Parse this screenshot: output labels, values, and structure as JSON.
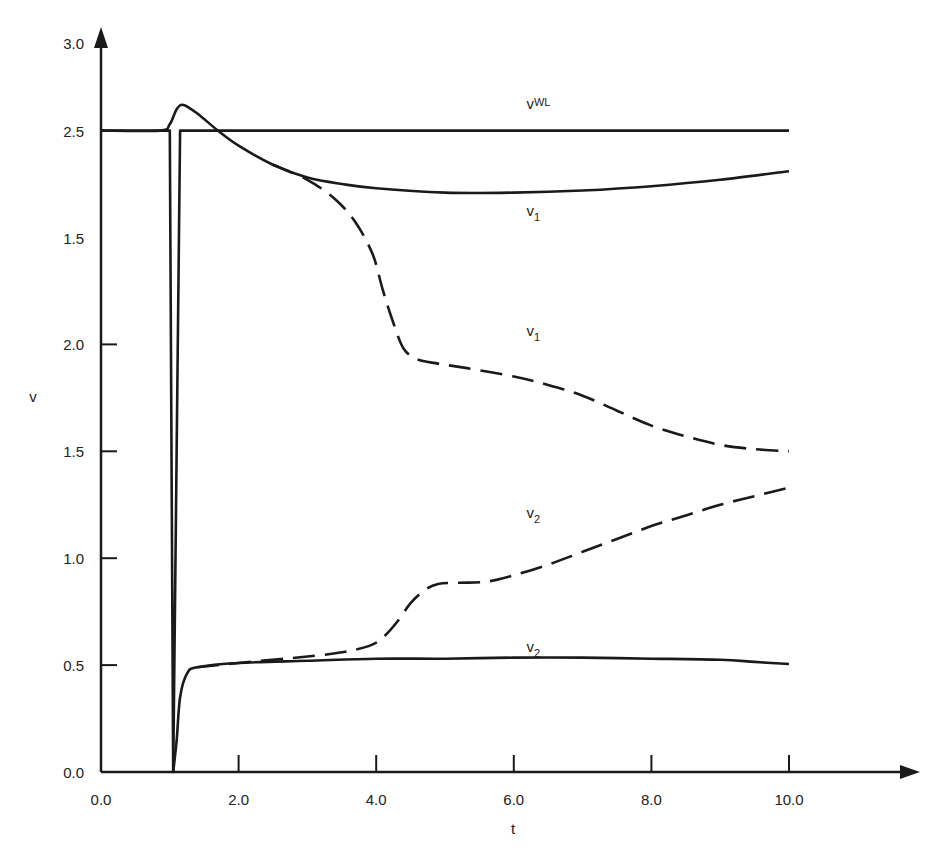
{
  "chart_data": {
    "type": "line",
    "title": "",
    "xlabel": "t",
    "ylabel": "v",
    "xlim": [
      0,
      12
    ],
    "ylim": [
      0,
      3.4
    ],
    "grid": false,
    "legend": "none (curves labeled inline)",
    "x_ticks": [
      "0.0",
      "2.0",
      "4.0",
      "6.0",
      "8.0",
      "10.0"
    ],
    "x_tick_values": [
      0,
      2,
      4,
      6,
      8,
      10
    ],
    "y_ticks": [
      "0.0",
      "0.5",
      "1.0",
      "1.5",
      "2.0",
      "1.5",
      "2.5",
      "3.0"
    ],
    "y_tick_positions": [
      0,
      0.5,
      1.0,
      1.5,
      2.0,
      2.5,
      3.0,
      3.41
    ],
    "y_tick_note": "Printed y-axis labels from bottom to top read 0.0, 0.5, 1.0, 1.5, 2.0, 1.5, 2.5, 3.0 (evenly spaced ticks; values below are in evenly spaced tick-position units)",
    "series": [
      {
        "name": "v_WL",
        "label": "v",
        "label_sub": "WL",
        "style": "solid",
        "x": [
          0,
          1.0,
          1.05,
          1.15,
          10.0
        ],
        "values": [
          3.0,
          3.0,
          0.0,
          3.0,
          3.0
        ]
      },
      {
        "name": "v_1 (solid)",
        "label": "v",
        "label_sub": "1",
        "style": "solid",
        "x": [
          0,
          0.85,
          1.0,
          1.1,
          1.2,
          1.4,
          1.7,
          2.0,
          2.5,
          3.0,
          3.5,
          4.0,
          5.0,
          6.0,
          7.0,
          8.0,
          9.0,
          10.0
        ],
        "values": [
          3.0,
          3.0,
          3.03,
          3.1,
          3.12,
          3.08,
          3.0,
          2.93,
          2.84,
          2.78,
          2.75,
          2.73,
          2.71,
          2.71,
          2.72,
          2.74,
          2.77,
          2.81
        ]
      },
      {
        "name": "v_1 (dashed)",
        "label": "v",
        "label_sub": "1",
        "style": "dashed",
        "x": [
          2.5,
          3.0,
          3.4,
          3.7,
          3.95,
          4.1,
          4.25,
          4.4,
          4.6,
          4.9,
          5.3,
          6.0,
          6.5,
          7.0,
          7.5,
          8.0,
          8.5,
          9.0,
          9.5,
          10.0
        ],
        "values": [
          2.84,
          2.77,
          2.68,
          2.57,
          2.42,
          2.25,
          2.1,
          1.98,
          1.93,
          1.91,
          1.89,
          1.85,
          1.81,
          1.76,
          1.69,
          1.62,
          1.57,
          1.53,
          1.51,
          1.5
        ]
      },
      {
        "name": "v_2 (solid)",
        "label": "v",
        "label_sub": "2",
        "style": "solid",
        "x": [
          1.05,
          1.1,
          1.15,
          1.25,
          1.4,
          2.0,
          3.0,
          4.0,
          5.0,
          6.0,
          7.0,
          8.0,
          9.0,
          9.5,
          10.0
        ],
        "values": [
          0.0,
          0.15,
          0.35,
          0.46,
          0.49,
          0.51,
          0.52,
          0.53,
          0.53,
          0.535,
          0.535,
          0.53,
          0.525,
          0.515,
          0.505
        ]
      },
      {
        "name": "v_2 (dashed)",
        "label": "v",
        "label_sub": "2",
        "style": "dashed",
        "x": [
          1.4,
          2.0,
          3.0,
          3.5,
          3.9,
          4.1,
          4.3,
          4.5,
          4.7,
          4.9,
          5.2,
          5.6,
          6.0,
          6.5,
          7.0,
          7.5,
          8.0,
          8.5,
          9.0,
          9.5,
          10.0
        ],
        "values": [
          0.49,
          0.51,
          0.54,
          0.56,
          0.59,
          0.63,
          0.7,
          0.79,
          0.85,
          0.88,
          0.885,
          0.89,
          0.92,
          0.97,
          1.03,
          1.09,
          1.15,
          1.2,
          1.25,
          1.29,
          1.33
        ]
      }
    ],
    "annotations": [
      {
        "text": "v",
        "sub": "WL",
        "x": 6.3,
        "y": 3.1
      },
      {
        "text": "v",
        "sub": "1",
        "x": 6.3,
        "y": 2.6
      },
      {
        "text": "v",
        "sub": "1",
        "x": 6.3,
        "y": 2.04
      },
      {
        "text": "v",
        "sub": "2",
        "x": 6.3,
        "y": 1.19
      },
      {
        "text": "v",
        "sub": "2",
        "x": 6.3,
        "y": 0.56
      }
    ]
  },
  "axes": {
    "x_title": "t",
    "y_title": "v"
  }
}
